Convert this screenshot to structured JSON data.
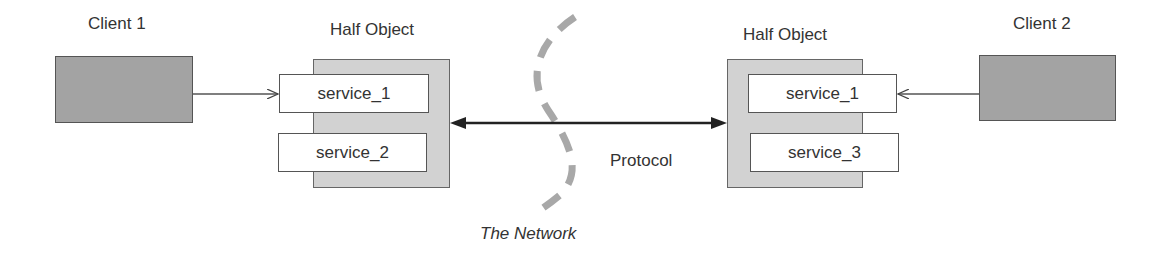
{
  "diagram": {
    "left": {
      "client_label": "Client 1",
      "half_object_label": "Half Object",
      "services": [
        "service_1",
        "service_2"
      ]
    },
    "right": {
      "client_label": "Client 2",
      "half_object_label": "Half Object",
      "services": [
        "service_1",
        "service_3"
      ]
    },
    "protocol_label": "Protocol",
    "network_label": "The Network",
    "colors": {
      "client_fill": "#a3a3a3",
      "half_object_fill": "#d2d2d2",
      "service_fill": "#ffffff",
      "network_dash": "#a8a8a8",
      "line": "#333333"
    }
  }
}
